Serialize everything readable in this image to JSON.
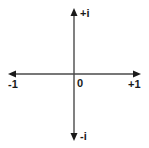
{
  "diagram": {
    "type": "complex-plane-axes",
    "colors": {
      "axis": "#4a4a4a",
      "arrow": "#1a1a1a",
      "text": "#1a1a1a",
      "background": "#ffffff"
    },
    "labels": {
      "pos_imag": "+i",
      "neg_imag": "-i",
      "neg_real": "-1",
      "pos_real": "+1",
      "origin": "0"
    }
  }
}
